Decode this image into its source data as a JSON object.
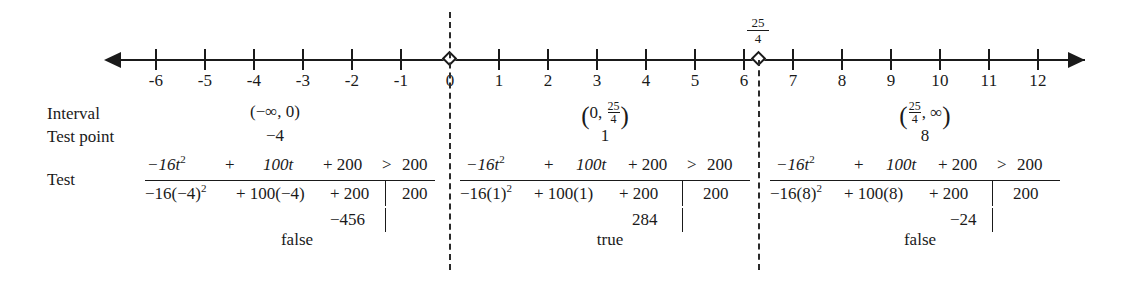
{
  "numberline": {
    "name": "number-line",
    "min": -6,
    "max": 12,
    "ticks": [
      -6,
      -5,
      -4,
      -3,
      -2,
      -1,
      0,
      1,
      2,
      3,
      4,
      5,
      6,
      7,
      8,
      9,
      10,
      11,
      12
    ],
    "tick_labels": [
      "-6",
      "-5",
      "-4",
      "-3",
      "-2",
      "-1",
      "0",
      "1",
      "2",
      "3",
      "4",
      "5",
      "6",
      "7",
      "8",
      "9",
      "10",
      "11",
      "12"
    ],
    "open_points": [
      {
        "value": 0,
        "label": "",
        "label_num": "",
        "label_den": ""
      },
      {
        "value": 6.25,
        "label": "25/4",
        "label_num": "25",
        "label_den": "4"
      }
    ],
    "arrow_left": "left-arrowhead",
    "arrow_right": "right-arrowhead"
  },
  "row_labels": {
    "interval": "Interval",
    "test_point": "Test point",
    "test": "Test"
  },
  "columns": [
    {
      "id": "col-1",
      "interval_open": "(",
      "interval_text": "−∞, 0",
      "interval_close": ")",
      "interval_has_fraction": false,
      "test_point": "−4",
      "numerator": {
        "term1": "−16t",
        "term1_sup": "2",
        "plus1": "+",
        "term2": "100t",
        "plus2": "+ 200",
        "rel": ">",
        "rhs": "200"
      },
      "denominator": {
        "expr1": "−16(−4)",
        "expr1_sup": "2",
        "expr2": "+ 100(−4)",
        "expr3": "+ 200",
        "rhs": "200"
      },
      "result_value": "−456",
      "verdict": "false"
    },
    {
      "id": "col-2",
      "interval_open": "(",
      "interval_text": "0, ",
      "interval_close": ")",
      "interval_has_fraction": true,
      "frac_num": "25",
      "frac_den": "4",
      "frac_side": "right",
      "test_point": "1",
      "numerator": {
        "term1": "−16t",
        "term1_sup": "2",
        "plus1": "+",
        "term2": "100t",
        "plus2": "+ 200",
        "rel": ">",
        "rhs": "200"
      },
      "denominator": {
        "expr1": "−16(1)",
        "expr1_sup": "2",
        "expr2": "+ 100(1)",
        "expr3": "+ 200",
        "rhs": "200"
      },
      "result_value": "284",
      "verdict": "true"
    },
    {
      "id": "col-3",
      "interval_open": "(",
      "interval_text": ", ∞",
      "interval_close": ")",
      "interval_has_fraction": true,
      "frac_num": "25",
      "frac_den": "4",
      "frac_side": "left",
      "test_point": "8",
      "numerator": {
        "term1": "−16t",
        "term1_sup": "2",
        "plus1": "+",
        "term2": "100t",
        "plus2": "+ 200",
        "rel": ">",
        "rhs": "200"
      },
      "denominator": {
        "expr1": "−16(8)",
        "expr1_sup": "2",
        "expr2": "+ 100(8)",
        "expr3": "+ 200",
        "rhs": "200"
      },
      "result_value": "−24",
      "verdict": "false"
    }
  ],
  "dividers": [
    {
      "name": "divider-at-0",
      "x": 449
    },
    {
      "name": "divider-at-25-4",
      "x": 758
    }
  ],
  "colors": {
    "ink": "#1a1a1a",
    "background": "#ffffff"
  }
}
